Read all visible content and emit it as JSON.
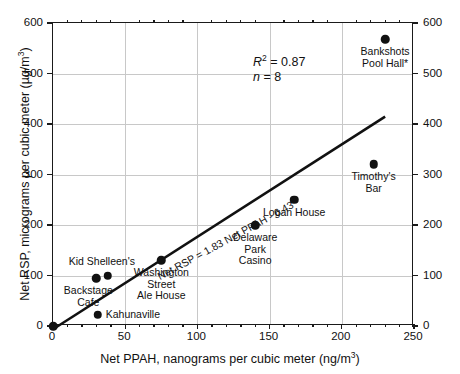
{
  "chart_data": {
    "type": "scatter",
    "title": "",
    "xlabel": "Net PPAH, nanograms per cubic meter  (ng/m3)",
    "xlabel_main": "Net PPAH, nanograms per cubic meter  (ng/m",
    "xlabel_sup": "3",
    "xlabel_tail": ")",
    "ylabel": "Net RSP, micrograms per cubic meter (µg/m3)",
    "ylabel_main": "Net RSP, micrograms per cubic meter (µg/m",
    "ylabel_sup": "3",
    "ylabel_tail": ")",
    "xlim": [
      0,
      250
    ],
    "ylim": [
      0,
      600
    ],
    "xticks": [
      0,
      50,
      100,
      150,
      200,
      250
    ],
    "xtick_labels": [
      "0",
      "50",
      "100",
      "150",
      "200",
      "250"
    ],
    "yticks": [
      0,
      100,
      200,
      300,
      400,
      500,
      600
    ],
    "ytick_labels": [
      "0",
      "100",
      "200",
      "300",
      "400",
      "500",
      "600"
    ],
    "ytick_labels_right": [
      "0",
      "100",
      "200",
      "300",
      "400",
      "500",
      "600"
    ],
    "x_minor_step": 10,
    "grid": true,
    "legend": "none",
    "marker_color": "#111111",
    "line_color": "#111111",
    "grid_color": "#c8c8c8",
    "axis_color": "#1a1a1a",
    "points": [
      {
        "label": "",
        "x": 0,
        "y": 0,
        "label_pos": "none"
      },
      {
        "label": "Kahunaville",
        "x": 31,
        "y": 22,
        "label_pos": "right"
      },
      {
        "label": "Backstage\nCafe",
        "x": 30,
        "y": 95,
        "label_pos": "belowleft"
      },
      {
        "label": "Kid Shelleen's",
        "x": 38,
        "y": 100,
        "label_pos": "above"
      },
      {
        "label": "Washington\nStreet\nAle House",
        "x": 75,
        "y": 130,
        "label_pos": "below"
      },
      {
        "label": "Delaware\nPark\nCasino",
        "x": 140,
        "y": 200,
        "label_pos": "below"
      },
      {
        "label": "Logan House",
        "x": 167,
        "y": 250,
        "label_pos": "below"
      },
      {
        "label": "Timothy's\nBar",
        "x": 222,
        "y": 320,
        "label_pos": "below"
      },
      {
        "label": "Bankshots\nPool Hall*",
        "x": 230,
        "y": 568,
        "label_pos": "below"
      }
    ],
    "regression": {
      "equation": "Net  RSP = 1.83 Net PPAH - 6.43",
      "slope": 1.83,
      "intercept": -6.43,
      "x_start": 0,
      "x_end": 230
    },
    "annotations": {
      "r_squared_symbol": "R",
      "r_squared_sup": "2",
      "r_squared_value": " = 0.87",
      "n_symbol": "n",
      "n_value": " = 8"
    }
  }
}
